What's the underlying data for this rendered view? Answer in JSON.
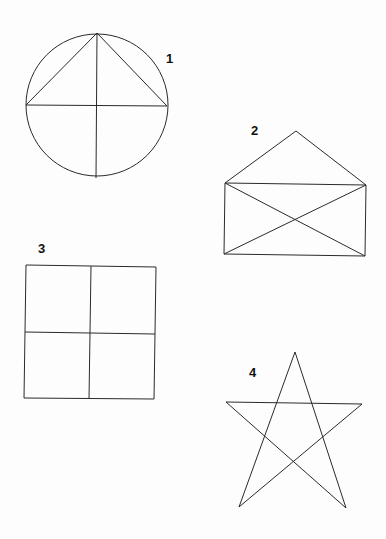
{
  "figures": [
    {
      "id": "1",
      "label": "1",
      "shape": "circle with inscribed triangle and perpendicular diameters"
    },
    {
      "id": "2",
      "label": "2",
      "shape": "envelope: rectangle with diagonals and triangular flap"
    },
    {
      "id": "3",
      "label": "3",
      "shape": "square divided into four quadrants"
    },
    {
      "id": "4",
      "label": "4",
      "shape": "five-pointed star (pentagram)"
    }
  ],
  "colors": {
    "stroke": "#2a2a2a",
    "background": "#fdfdfd",
    "label": "#111111"
  }
}
